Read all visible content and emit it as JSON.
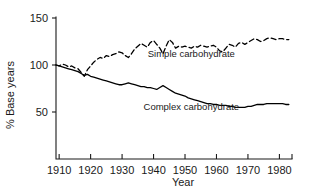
{
  "chart_data": {
    "type": "line",
    "title": "",
    "xlabel": "Year",
    "ylabel": "% Base years",
    "xlim": [
      1909,
      1984
    ],
    "ylim": [
      0,
      150
    ],
    "xticks": [
      1910,
      1920,
      1930,
      1940,
      1950,
      1960,
      1970,
      1980
    ],
    "xtick_labels": [
      "1910",
      "1920",
      "1930",
      "1940",
      "1950",
      "1960",
      "1970",
      "1980"
    ],
    "yticks": [
      50,
      100,
      150
    ],
    "ytick_labels": [
      "50",
      "100",
      "150"
    ],
    "grid": false,
    "legend_position": "inline-annotation",
    "series": [
      {
        "name": "Simple carbohydrate",
        "style": "dashed",
        "color": "#000000",
        "label_x": 1952,
        "label_y": 108,
        "x": [
          1909,
          1910,
          1911,
          1912,
          1913,
          1914,
          1915,
          1916,
          1917,
          1918,
          1919,
          1920,
          1921,
          1922,
          1923,
          1924,
          1925,
          1926,
          1927,
          1928,
          1929,
          1930,
          1931,
          1932,
          1933,
          1934,
          1935,
          1936,
          1937,
          1938,
          1939,
          1940,
          1941,
          1942,
          1943,
          1944,
          1945,
          1946,
          1947,
          1948,
          1949,
          1950,
          1951,
          1952,
          1953,
          1954,
          1955,
          1956,
          1957,
          1958,
          1959,
          1960,
          1961,
          1962,
          1963,
          1964,
          1965,
          1966,
          1967,
          1968,
          1969,
          1970,
          1971,
          1972,
          1973,
          1974,
          1975,
          1976,
          1977,
          1978,
          1979,
          1980,
          1981,
          1982,
          1983
        ],
        "y": [
          100,
          99,
          101,
          100,
          98,
          99,
          97,
          96,
          92,
          88,
          95,
          99,
          103,
          106,
          108,
          107,
          110,
          109,
          111,
          112,
          114,
          113,
          110,
          108,
          112,
          117,
          120,
          123,
          121,
          119,
          124,
          126,
          122,
          118,
          112,
          120,
          127,
          124,
          118,
          120,
          119,
          120,
          119,
          118,
          120,
          119,
          121,
          120,
          119,
          120,
          121,
          119,
          115,
          114,
          118,
          122,
          121,
          119,
          123,
          124,
          122,
          124,
          126,
          128,
          127,
          125,
          126,
          128,
          129,
          128,
          127,
          128,
          128,
          127,
          127
        ]
      },
      {
        "name": "Complex carbohydrate",
        "style": "solid",
        "color": "#000000",
        "label_x": 1952,
        "label_y": 52,
        "x": [
          1909,
          1910,
          1911,
          1912,
          1913,
          1914,
          1915,
          1916,
          1917,
          1918,
          1919,
          1920,
          1921,
          1922,
          1923,
          1924,
          1925,
          1926,
          1927,
          1928,
          1929,
          1930,
          1931,
          1932,
          1933,
          1934,
          1935,
          1936,
          1937,
          1938,
          1939,
          1940,
          1941,
          1942,
          1943,
          1944,
          1945,
          1946,
          1947,
          1948,
          1949,
          1950,
          1951,
          1952,
          1953,
          1954,
          1955,
          1956,
          1957,
          1958,
          1959,
          1960,
          1961,
          1962,
          1963,
          1964,
          1965,
          1966,
          1967,
          1968,
          1969,
          1970,
          1971,
          1972,
          1973,
          1974,
          1975,
          1976,
          1977,
          1978,
          1979,
          1980,
          1981,
          1982,
          1983
        ],
        "y": [
          100,
          99,
          98,
          97,
          96,
          95,
          94,
          93,
          91,
          89,
          90,
          88,
          87,
          86,
          85,
          84,
          83,
          82,
          81,
          80,
          79,
          79,
          80,
          81,
          80,
          79,
          78,
          77,
          77,
          76,
          76,
          75,
          74,
          76,
          78,
          76,
          74,
          72,
          70,
          69,
          68,
          67,
          65,
          64,
          63,
          62,
          61,
          60,
          59,
          59,
          58,
          58,
          57,
          57,
          57,
          56,
          56,
          55,
          55,
          55,
          55,
          56,
          56,
          57,
          58,
          58,
          58,
          59,
          59,
          59,
          59,
          59,
          59,
          58,
          58
        ]
      }
    ]
  }
}
